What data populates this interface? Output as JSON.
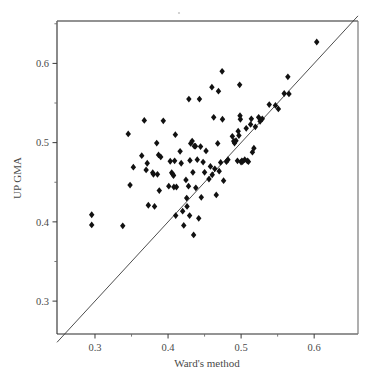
{
  "chart_data": {
    "type": "scatter",
    "title": "",
    "xlabel": "Ward's method",
    "ylabel": "UP GMA",
    "xlim": [
      0.248,
      0.66
    ],
    "ylim": [
      0.2585,
      0.6535
    ],
    "grid": false,
    "legend": null,
    "xticks": [
      0.3,
      0.4,
      0.5,
      0.6
    ],
    "yticks": [
      0.3,
      0.4,
      0.5,
      0.6
    ],
    "xtick_labels": [
      "0.3",
      "0.4",
      "0.5",
      "0.6"
    ],
    "ytick_labels": [
      "0.3",
      "0.4",
      "0.5",
      "0.6"
    ],
    "xminor_ticks": [
      0.35,
      0.45,
      0.55
    ],
    "yminor_ticks": [
      0.35,
      0.45,
      0.55,
      0.65
    ],
    "reference_line": {
      "name": "identity-line",
      "equation": "y = x",
      "from": [
        0.248,
        0.248
      ],
      "to": [
        0.66,
        0.66
      ]
    },
    "marker": {
      "shape": "diamond",
      "color": "#111111",
      "size": 3.4
    },
    "n_points": 105,
    "points": [
      [
        0.2955,
        0.409
      ],
      [
        0.2955,
        0.3962
      ],
      [
        0.338,
        0.395
      ],
      [
        0.3455,
        0.511
      ],
      [
        0.348,
        0.4465
      ],
      [
        0.3525,
        0.469
      ],
      [
        0.364,
        0.4835
      ],
      [
        0.3675,
        0.528
      ],
      [
        0.37,
        0.4655
      ],
      [
        0.3715,
        0.474
      ],
      [
        0.373,
        0.421
      ],
      [
        0.379,
        0.462
      ],
      [
        0.38,
        0.46
      ],
      [
        0.3815,
        0.4195
      ],
      [
        0.3845,
        0.4995
      ],
      [
        0.3855,
        0.46
      ],
      [
        0.387,
        0.4845
      ],
      [
        0.388,
        0.4395
      ],
      [
        0.39,
        0.482
      ],
      [
        0.3935,
        0.5275
      ],
      [
        0.401,
        0.445
      ],
      [
        0.403,
        0.4765
      ],
      [
        0.405,
        0.462
      ],
      [
        0.4065,
        0.46
      ],
      [
        0.4075,
        0.4585
      ],
      [
        0.408,
        0.444
      ],
      [
        0.409,
        0.477
      ],
      [
        0.41,
        0.51
      ],
      [
        0.4105,
        0.408
      ],
      [
        0.4115,
        0.444
      ],
      [
        0.4165,
        0.489
      ],
      [
        0.418,
        0.474
      ],
      [
        0.42,
        0.4135
      ],
      [
        0.4215,
        0.3955
      ],
      [
        0.4245,
        0.453
      ],
      [
        0.4255,
        0.43
      ],
      [
        0.426,
        0.4195
      ],
      [
        0.428,
        0.445
      ],
      [
        0.4285,
        0.555
      ],
      [
        0.4295,
        0.408
      ],
      [
        0.43,
        0.4775
      ],
      [
        0.431,
        0.499
      ],
      [
        0.433,
        0.502
      ],
      [
        0.434,
        0.4625
      ],
      [
        0.435,
        0.3835
      ],
      [
        0.436,
        0.4955
      ],
      [
        0.4375,
        0.4955
      ],
      [
        0.438,
        0.443
      ],
      [
        0.44,
        0.4785
      ],
      [
        0.442,
        0.4045
      ],
      [
        0.443,
        0.555
      ],
      [
        0.4445,
        0.495
      ],
      [
        0.4455,
        0.431
      ],
      [
        0.448,
        0.4755
      ],
      [
        0.45,
        0.4625
      ],
      [
        0.452,
        0.4895
      ],
      [
        0.456,
        0.454
      ],
      [
        0.458,
        0.47
      ],
      [
        0.46,
        0.57
      ],
      [
        0.4605,
        0.4595
      ],
      [
        0.4625,
        0.532
      ],
      [
        0.464,
        0.467
      ],
      [
        0.466,
        0.434
      ],
      [
        0.468,
        0.499
      ],
      [
        0.469,
        0.565
      ],
      [
        0.47,
        0.464
      ],
      [
        0.472,
        0.475
      ],
      [
        0.474,
        0.59
      ],
      [
        0.4745,
        0.5295
      ],
      [
        0.476,
        0.452
      ],
      [
        0.48,
        0.476
      ],
      [
        0.482,
        0.4785
      ],
      [
        0.488,
        0.508
      ],
      [
        0.49,
        0.502
      ],
      [
        0.4905,
        0.501
      ],
      [
        0.491,
        0.4995
      ],
      [
        0.493,
        0.5025
      ],
      [
        0.495,
        0.477
      ],
      [
        0.496,
        0.5145
      ],
      [
        0.497,
        0.509
      ],
      [
        0.498,
        0.573
      ],
      [
        0.4985,
        0.534
      ],
      [
        0.499,
        0.5295
      ],
      [
        0.5,
        0.4755
      ],
      [
        0.501,
        0.477
      ],
      [
        0.502,
        0.476
      ],
      [
        0.505,
        0.4785
      ],
      [
        0.507,
        0.518
      ],
      [
        0.5085,
        0.477
      ],
      [
        0.51,
        0.476
      ],
      [
        0.513,
        0.523
      ],
      [
        0.514,
        0.53
      ],
      [
        0.5155,
        0.488
      ],
      [
        0.5175,
        0.493
      ],
      [
        0.5195,
        0.52
      ],
      [
        0.524,
        0.532
      ],
      [
        0.526,
        0.527
      ],
      [
        0.529,
        0.53
      ],
      [
        0.5385,
        0.548
      ],
      [
        0.547,
        0.547
      ],
      [
        0.551,
        0.5425
      ],
      [
        0.559,
        0.562
      ],
      [
        0.564,
        0.583
      ],
      [
        0.5655,
        0.5615
      ],
      [
        0.6035,
        0.627
      ]
    ]
  },
  "axes": {
    "x_title": "Ward's method",
    "y_title": "UP GMA"
  }
}
